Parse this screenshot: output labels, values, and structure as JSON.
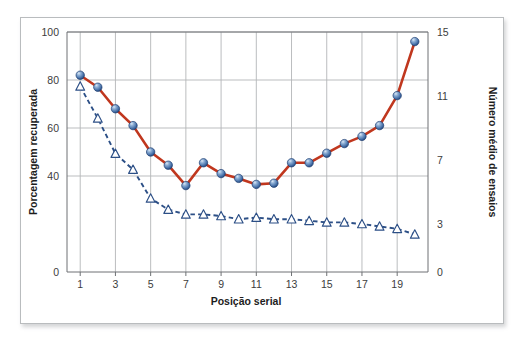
{
  "chart_data": {
    "type": "line",
    "title": "",
    "xlabel": "Posição serial",
    "ylabel": "Porcentagem recuperada",
    "y2label": "Número médio de ensaios",
    "grid": true,
    "legend": "none",
    "xlim": [
      0.25,
      20.75
    ],
    "ylim": [
      0,
      100
    ],
    "y2lim": [
      0,
      15
    ],
    "x": [
      1,
      2,
      3,
      4,
      5,
      6,
      7,
      8,
      9,
      10,
      11,
      12,
      13,
      14,
      15,
      16,
      17,
      18,
      19,
      20
    ],
    "xticks": [
      1,
      3,
      5,
      7,
      9,
      11,
      13,
      15,
      17,
      19
    ],
    "xticklabels": [
      "1",
      "3",
      "5",
      "7",
      "9",
      "11",
      "13",
      "15",
      "17",
      "19"
    ],
    "yticks": [
      0,
      40,
      60,
      80,
      100
    ],
    "yticklabels": [
      "0",
      "40",
      "60",
      "80",
      "100"
    ],
    "y2ticks": [
      0,
      3,
      7,
      11,
      15
    ],
    "y2ticklabels": [
      "0",
      "3",
      "7",
      "11",
      "15"
    ],
    "series": [
      {
        "name": "Porcentagem recuperada",
        "axis": "left",
        "color": "#c0371e",
        "marker": "circle",
        "marker_fill": "#4a78b4",
        "marker_edge": "#1f3f72",
        "linestyle": "solid",
        "values": [
          82,
          77,
          68,
          61,
          50,
          44.5,
          36,
          45.5,
          41,
          39,
          36.5,
          37,
          45.5,
          45.5,
          49.5,
          53.5,
          56.5,
          61,
          73.5,
          96
        ]
      },
      {
        "name": "Número médio de ensaios",
        "axis": "right",
        "color": "#2c4f86",
        "marker": "triangle",
        "marker_fill": "#ffffff",
        "marker_edge": "#2c4f86",
        "linestyle": "dashed",
        "values": [
          11.6,
          9.6,
          7.4,
          6.4,
          4.6,
          3.9,
          3.6,
          3.6,
          3.5,
          3.3,
          3.4,
          3.3,
          3.3,
          3.2,
          3.1,
          3.1,
          3.0,
          2.85,
          2.7,
          2.35
        ]
      }
    ]
  },
  "axes": {
    "x_title": "Posição serial",
    "y_left_title": "Porcentagem recuperada",
    "y_right_title": "Número médio de ensaios"
  },
  "colors": {
    "red_line": "#c0371e",
    "blue_line": "#2c4f86",
    "marker_blue": "#4a78b4",
    "grid": "#b3b6b8",
    "axis": "#6e7174",
    "frame": "#b9bcbe",
    "background": "#ffffff"
  }
}
